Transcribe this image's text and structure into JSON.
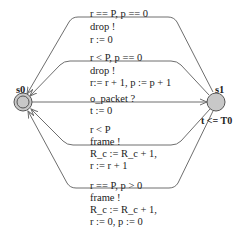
{
  "diagram": {
    "type": "timed-automaton",
    "states": [
      {
        "id": "s0",
        "label": "s0",
        "initial": true
      },
      {
        "id": "s1",
        "label": "s1",
        "invariant": "t <= T0"
      }
    ],
    "edges": [
      {
        "from": "s1",
        "to": "s0",
        "guard": "r == P, p == 0",
        "sync": "drop !",
        "update": "r := 0"
      },
      {
        "from": "s1",
        "to": "s0",
        "guard": "r < P, p == 0",
        "sync": "drop !",
        "update": "r:= r + 1, p := p + 1"
      },
      {
        "from": "s0",
        "to": "s1",
        "guard": "",
        "sync": "o_packet ?",
        "update": "t := 0"
      },
      {
        "from": "s1",
        "to": "s0",
        "guard": "r < P",
        "sync": "frame !",
        "update": "R_c := R_c + 1,",
        "update2": "r := r + 1"
      },
      {
        "from": "s1",
        "to": "s0",
        "guard": "r == P, p > 0",
        "sync": "frame !",
        "update": "R_c := R_c + 1,",
        "update2": "r := 0, p := 0"
      }
    ],
    "colors": {
      "state_fill": "#c8c8c8",
      "edge": "#6e6e6e",
      "text": "#222222"
    }
  }
}
